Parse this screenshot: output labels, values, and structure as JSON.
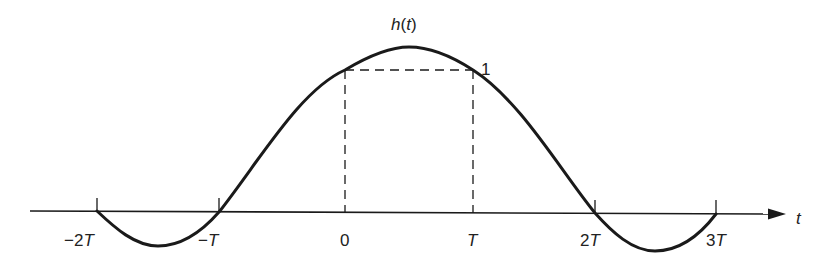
{
  "diagram": {
    "curve_label": "h(t)",
    "curve_label_parts": {
      "fn": "h",
      "open": "(",
      "var": "t",
      "close": ")"
    },
    "value_label": "1",
    "axis_label": "t",
    "ticks": [
      {
        "label_prefix": "−2",
        "label_var": "T",
        "x": 97
      },
      {
        "label_prefix": "−",
        "label_var": "T",
        "x": 219
      },
      {
        "label_prefix": "0",
        "label_var": "",
        "x": 345
      },
      {
        "label_prefix": "",
        "label_var": "T",
        "x": 473
      },
      {
        "label_prefix": "2",
        "label_var": "T",
        "x": 595
      },
      {
        "label_prefix": "3",
        "label_var": "T",
        "x": 716
      }
    ],
    "colors": {
      "stroke": "#1a1a1a",
      "background": "#ffffff"
    }
  }
}
